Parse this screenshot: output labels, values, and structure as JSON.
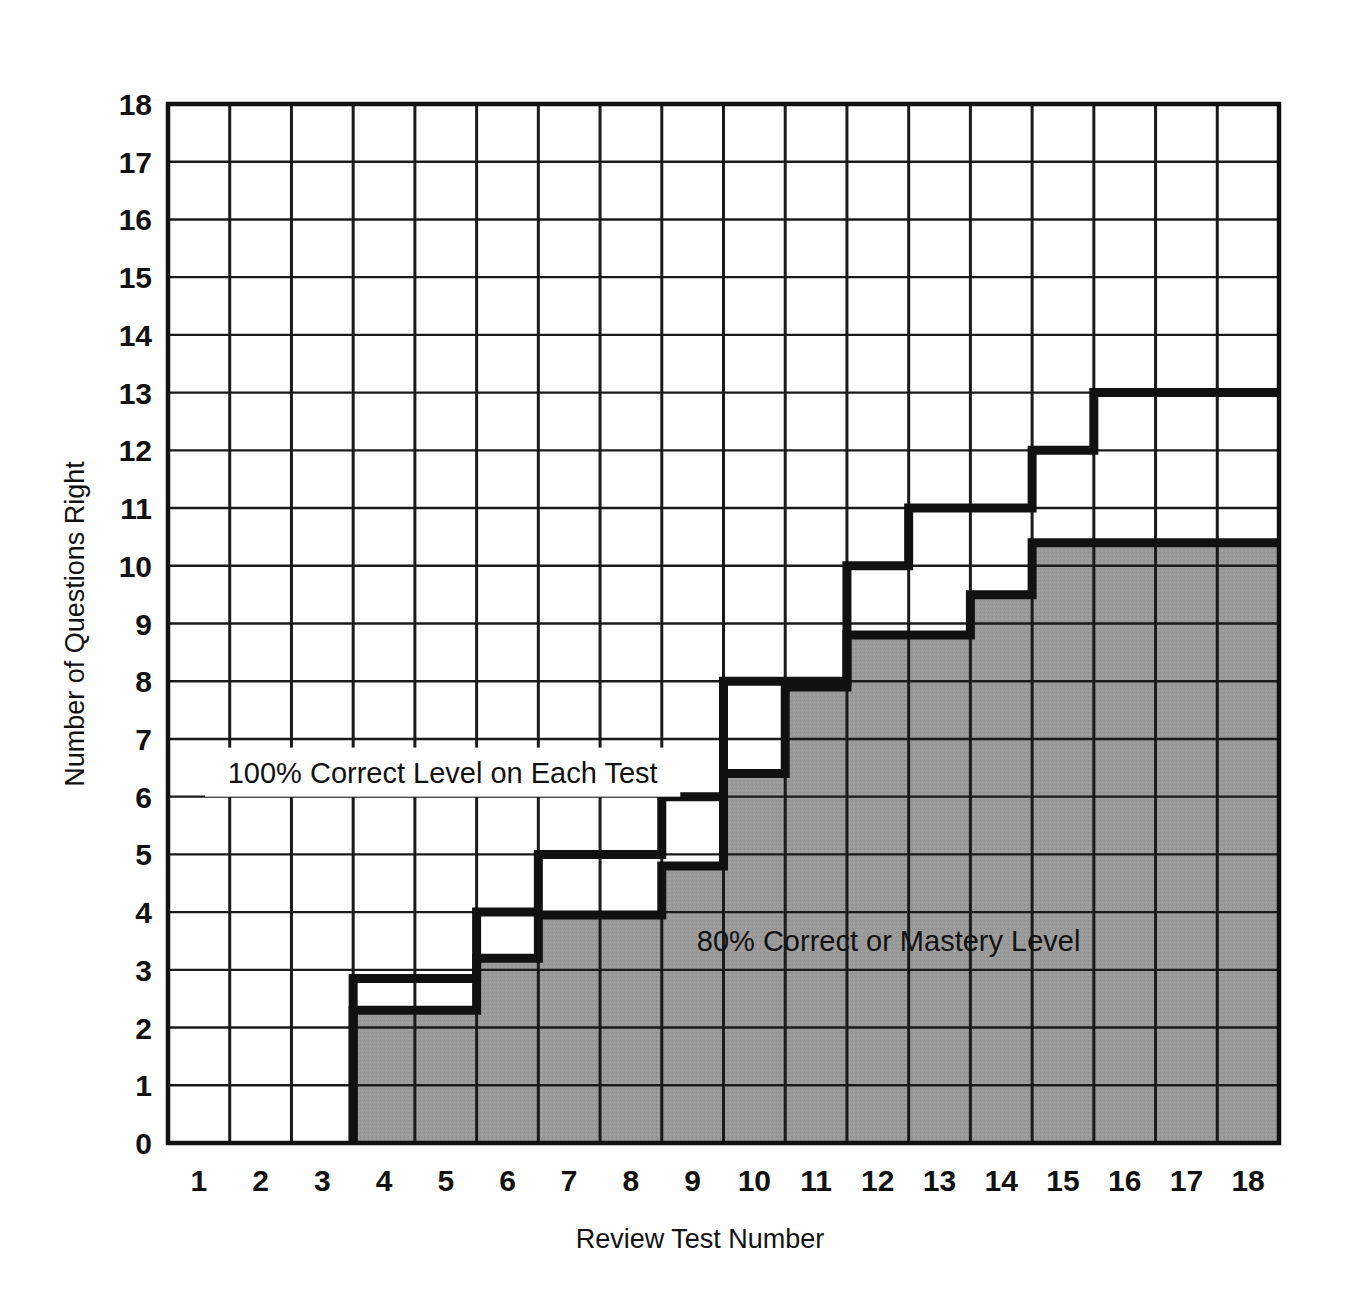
{
  "chart_data": {
    "type": "bar",
    "title": "",
    "subtitle": "",
    "xlabel": "Review Test Number",
    "ylabel": "Number of Questions Right",
    "categories": [
      1,
      2,
      3,
      4,
      5,
      6,
      7,
      8,
      9,
      10,
      11,
      12,
      13,
      14,
      15,
      16,
      17,
      18
    ],
    "xtick_labels": [
      "1",
      "2",
      "3",
      "4",
      "5",
      "6",
      "7",
      "8",
      "9",
      "10",
      "11",
      "12",
      "13",
      "14",
      "15",
      "16",
      "17",
      "18"
    ],
    "ytick_labels": [
      "0",
      "1",
      "2",
      "3",
      "4",
      "5",
      "6",
      "7",
      "8",
      "9",
      "10",
      "11",
      "12",
      "13",
      "14",
      "15",
      "16",
      "17",
      "18"
    ],
    "xlim": [
      0.5,
      18.5
    ],
    "ylim": [
      0,
      18
    ],
    "grid": true,
    "legend_position": "inside-plot",
    "series": [
      {
        "name": "100% Correct Level on Each Test",
        "style": "step-outline-black",
        "values": [
          0,
          0,
          0,
          2.85,
          2.85,
          4,
          5,
          5,
          6,
          8,
          8,
          10,
          11,
          11,
          12,
          13,
          13,
          13
        ]
      },
      {
        "name": "80% Correct or Mastery Level",
        "style": "step-filled-gray",
        "values": [
          0,
          0,
          0,
          2.3,
          2.3,
          3.2,
          3.95,
          3.95,
          4.8,
          6.4,
          7.9,
          8.8,
          8.8,
          9.5,
          10.4,
          10.4,
          10.4,
          10.4
        ]
      }
    ],
    "annotations": [
      {
        "id": "annotation-100-percent",
        "text": "100% Correct Level on Each Test",
        "x_range": [
          1.1,
          8.8
        ],
        "y_range": [
          6.0,
          6.85
        ],
        "boxed": true,
        "box_fill": "#ffffff"
      },
      {
        "id": "annotation-80-percent",
        "text": "80% Correct or Mastery Level",
        "x_range": [
          8.35,
          16.0
        ],
        "y_range": [
          3.1,
          3.95
        ],
        "boxed": false,
        "box_fill": "none"
      }
    ],
    "colors": {
      "background": "#ffffff",
      "gray_fill": "#9a9a9a",
      "outline": "#111111",
      "gridline": "#1a1a1a",
      "text": "#111111"
    }
  }
}
